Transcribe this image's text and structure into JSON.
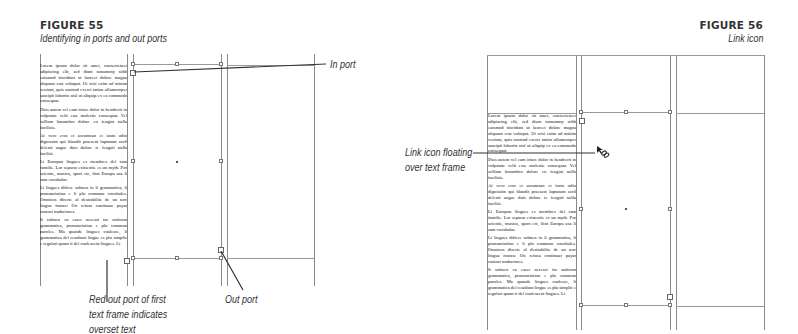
{
  "figure55": {
    "number": "FIGURE 55",
    "caption": "Identifying in ports and out ports",
    "callouts": {
      "in_port": "In port",
      "out_port": "Out port",
      "red_out_port": [
        "Red out port of first",
        "text frame indicates",
        "overset text"
      ]
    },
    "text_frame_paragraphs": [
      "Lorem ipsum dolor sit amet, consectetuer adipiscing elit, sed diam nonummy nibh euismod tincidunt ut laoreet dolore magna aliquam erat volutpat. Ut wisi enim ad minim veniam, quis nostrud exerci tation ullamcorper suscipit lobortis nisl ut aliquip ex ea commodo consequat.",
      "Duis autem vel eum iriure dolor in hendrerit in vulputate velit esse molestie consequat. Vel willum lunombro dolore eu feugiat nulla facilisis.",
      "At vero eros et accumsan et iusto odio dignissim qui blandit praesent luptatum zzril delenit augue duis dolore te feugait nulla facilisi.",
      "Li Europan lingues es membres del sam familie. Lor separat existentie es un myth. Por scientie, musica, sport etc, litot Europa usa li sam vocabular.",
      "Li lingues differe solmen in li grammatica, li pronunciation e li plu commun vocabules. Omnicos directe al desirabilite de un nov lingua franca: On refusa continuar payar custosi traductores.",
      "It solmen va esser necessi far uniform grammatica, pronunciation e plu commun paroles. Ma quande lingues coalesce, li grammatica del resultant lingue es plu simplic e regulari quam ti del coalescent lingues. Li"
    ]
  },
  "figure56": {
    "number": "FIGURE 56",
    "caption": "Link icon",
    "callouts": {
      "link_icon": [
        "Link icon floating",
        "over text frame"
      ]
    },
    "link_icon": "chain-link-icon",
    "text_frame_paragraphs": [
      "Lorem ipsum dolor sit amet, consectetuer adipiscing elit, sed diam nonummy nibh euismod tincidunt ut laoreet dolore magna aliquam erat volutpat. Ut wisi enim ad minim veniam, quis nostrud exerci tation ullamcorper suscipit lobortis nisl ut aliquip ex ea commodo consequat.",
      "Duis autem vel eum iriure dolor in hendrerit in vulputate velit esse molestie consequat. Vel willum lunombro dolore eu feugiat nulla facilisis.",
      "At vero eros et accumsan et iusto odio dignissim qui blandit praesent luptatum zzril delenit augue duis dolore te feugait nulla facilisi.",
      "Li Europan lingues es membres del sam familie. Lor separat existentie es un myth. Por scientie, musica, sport etc, litot Europa usa li sam vocabular.",
      "Li lingues differe solmen in li grammatica, li pronunciation e li plu commun vocabules. Omnicos directe al desirabilite de un nov lingua franca: On refusa continuar payar custosi traductores.",
      "It solmen va esser necessi far uniform grammatica, pronunciation e plu commun paroles. Ma quande lingues coalesce, li grammatica del resultant lingue es plu simplic e regulari quam ti del coalescent lingues. Li"
    ]
  }
}
